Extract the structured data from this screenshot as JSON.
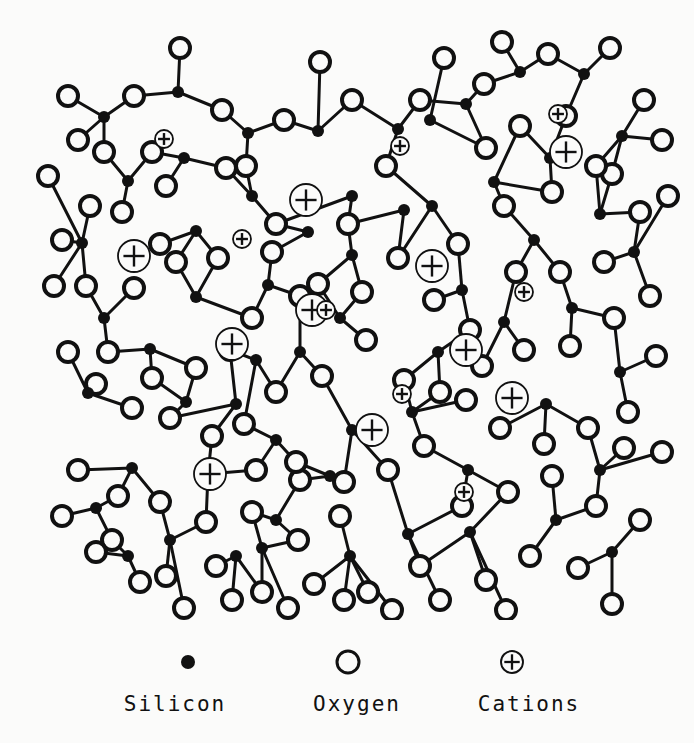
{
  "diagram": {
    "type": "atomic-network-schematic",
    "background_color": "#fbfbfa",
    "ink_color": "#111111",
    "style": {
      "bond_width": 3,
      "oxygen_radius": 10,
      "oxygen_stroke": 4,
      "silicon_radius": 6,
      "cation_large_radius": 16,
      "cation_small_radius": 9,
      "cation_stroke": 1.8
    }
  },
  "legend": {
    "items": [
      {
        "symbol": "filled-circle",
        "label": "Silicon",
        "cx": 188,
        "cy": 22,
        "r": 7
      },
      {
        "symbol": "open-circle",
        "label": "Oxygen",
        "cx": 348,
        "cy": 22,
        "r": 11
      },
      {
        "symbol": "circled-plus",
        "label": "Cations",
        "cx": 512,
        "cy": 22,
        "r": 11
      }
    ]
  },
  "chart_data": {
    "type": "scatter",
    "xlabel": "",
    "ylabel": "",
    "xlim": [
      0,
      694
    ],
    "ylim": [
      0,
      620
    ],
    "grid": false,
    "legend_position": "bottom",
    "series": [
      {
        "name": "Silicon",
        "marker": "filled-circle",
        "count": 60
      },
      {
        "name": "Oxygen",
        "marker": "open-circle",
        "count": 122
      },
      {
        "name": "Cations",
        "marker": "circled-plus",
        "count": 18
      }
    ],
    "silicon": [
      [
        104,
        117
      ],
      [
        178,
        92
      ],
      [
        248,
        133
      ],
      [
        128,
        181
      ],
      [
        196,
        231
      ],
      [
        82,
        243
      ],
      [
        104,
        318
      ],
      [
        196,
        297
      ],
      [
        268,
        285
      ],
      [
        252,
        196
      ],
      [
        318,
        131
      ],
      [
        352,
        255
      ],
      [
        300,
        352
      ],
      [
        186,
        402
      ],
      [
        208,
        474
      ],
      [
        132,
        468
      ],
      [
        276,
        520
      ],
      [
        352,
        430
      ],
      [
        276,
        440
      ],
      [
        398,
        129
      ],
      [
        432,
        206
      ],
      [
        466,
        104
      ],
      [
        520,
        72
      ],
      [
        584,
        74
      ],
      [
        622,
        136
      ],
      [
        462,
        290
      ],
      [
        534,
        240
      ],
      [
        600,
        214
      ],
      [
        438,
        352
      ],
      [
        504,
        322
      ],
      [
        572,
        308
      ],
      [
        620,
        372
      ],
      [
        546,
        404
      ],
      [
        468,
        470
      ],
      [
        408,
        534
      ],
      [
        350,
        556
      ],
      [
        262,
        548
      ],
      [
        170,
        540
      ],
      [
        96,
        508
      ],
      [
        150,
        349
      ],
      [
        256,
        360
      ],
      [
        340,
        318
      ],
      [
        600,
        470
      ],
      [
        556,
        520
      ],
      [
        470,
        532
      ],
      [
        634,
        252
      ],
      [
        88,
        393
      ],
      [
        330,
        476
      ],
      [
        430,
        120
      ],
      [
        612,
        552
      ],
      [
        236,
        556
      ],
      [
        128,
        556
      ],
      [
        404,
        210
      ],
      [
        494,
        182
      ],
      [
        550,
        158
      ],
      [
        352,
        196
      ],
      [
        236,
        404
      ],
      [
        308,
        232
      ],
      [
        184,
        158
      ],
      [
        412,
        412
      ]
    ],
    "oxygen": [
      [
        68,
        96
      ],
      [
        134,
        96
      ],
      [
        180,
        48
      ],
      [
        222,
        110
      ],
      [
        152,
        152
      ],
      [
        104,
        152
      ],
      [
        90,
        206
      ],
      [
        166,
        186
      ],
      [
        226,
        168
      ],
      [
        284,
        120
      ],
      [
        352,
        100
      ],
      [
        320,
        62
      ],
      [
        246,
        166
      ],
      [
        276,
        224
      ],
      [
        218,
        258
      ],
      [
        160,
        244
      ],
      [
        122,
        212
      ],
      [
        62,
        240
      ],
      [
        86,
        286
      ],
      [
        134,
        288
      ],
      [
        176,
        262
      ],
      [
        252,
        318
      ],
      [
        300,
        296
      ],
      [
        348,
        224
      ],
      [
        386,
        166
      ],
      [
        420,
        100
      ],
      [
        444,
        58
      ],
      [
        484,
        84
      ],
      [
        502,
        42
      ],
      [
        548,
        54
      ],
      [
        610,
        48
      ],
      [
        644,
        100
      ],
      [
        612,
        174
      ],
      [
        566,
        116
      ],
      [
        520,
        126
      ],
      [
        486,
        148
      ],
      [
        458,
        244
      ],
      [
        504,
        206
      ],
      [
        552,
        192
      ],
      [
        596,
        166
      ],
      [
        662,
        140
      ],
      [
        668,
        196
      ],
      [
        640,
        212
      ],
      [
        604,
        262
      ],
      [
        560,
        272
      ],
      [
        516,
        272
      ],
      [
        470,
        330
      ],
      [
        434,
        300
      ],
      [
        398,
        258
      ],
      [
        362,
        292
      ],
      [
        318,
        284
      ],
      [
        272,
        252
      ],
      [
        230,
        350
      ],
      [
        276,
        392
      ],
      [
        322,
        376
      ],
      [
        366,
        340
      ],
      [
        404,
        380
      ],
      [
        440,
        392
      ],
      [
        482,
        366
      ],
      [
        524,
        350
      ],
      [
        570,
        346
      ],
      [
        614,
        318
      ],
      [
        650,
        296
      ],
      [
        656,
        356
      ],
      [
        628,
        412
      ],
      [
        588,
        428
      ],
      [
        544,
        444
      ],
      [
        500,
        428
      ],
      [
        466,
        400
      ],
      [
        424,
        446
      ],
      [
        388,
        470
      ],
      [
        344,
        482
      ],
      [
        300,
        480
      ],
      [
        256,
        470
      ],
      [
        212,
        436
      ],
      [
        170,
        418
      ],
      [
        132,
        408
      ],
      [
        96,
        384
      ],
      [
        68,
        352
      ],
      [
        108,
        352
      ],
      [
        152,
        378
      ],
      [
        196,
        368
      ],
      [
        244,
        424
      ],
      [
        296,
        462
      ],
      [
        340,
        516
      ],
      [
        298,
        540
      ],
      [
        252,
        512
      ],
      [
        206,
        522
      ],
      [
        160,
        502
      ],
      [
        118,
        496
      ],
      [
        78,
        470
      ],
      [
        112,
        540
      ],
      [
        166,
        576
      ],
      [
        216,
        566
      ],
      [
        262,
        592
      ],
      [
        314,
        584
      ],
      [
        368,
        592
      ],
      [
        420,
        566
      ],
      [
        462,
        506
      ],
      [
        508,
        492
      ],
      [
        552,
        476
      ],
      [
        596,
        506
      ],
      [
        640,
        520
      ],
      [
        662,
        452
      ],
      [
        624,
        448
      ],
      [
        578,
        568
      ],
      [
        530,
        556
      ],
      [
        486,
        580
      ],
      [
        440,
        600
      ],
      [
        392,
        610
      ],
      [
        344,
        600
      ],
      [
        288,
        608
      ],
      [
        232,
        600
      ],
      [
        184,
        608
      ],
      [
        140,
        582
      ],
      [
        96,
        552
      ],
      [
        62,
        516
      ],
      [
        54,
        286
      ],
      [
        48,
        176
      ],
      [
        78,
        140
      ],
      [
        612,
        604
      ],
      [
        506,
        610
      ]
    ],
    "cations_large": [
      [
        306,
        200
      ],
      [
        134,
        256
      ],
      [
        432,
        266
      ],
      [
        232,
        344
      ],
      [
        566,
        152
      ],
      [
        372,
        430
      ],
      [
        210,
        474
      ],
      [
        512,
        398
      ],
      [
        466,
        350
      ],
      [
        312,
        310
      ]
    ],
    "cations_small": [
      [
        164,
        139
      ],
      [
        242,
        239
      ],
      [
        326,
        310
      ],
      [
        400,
        146
      ],
      [
        558,
        114
      ],
      [
        524,
        292
      ],
      [
        402,
        394
      ],
      [
        464,
        492
      ]
    ]
  }
}
